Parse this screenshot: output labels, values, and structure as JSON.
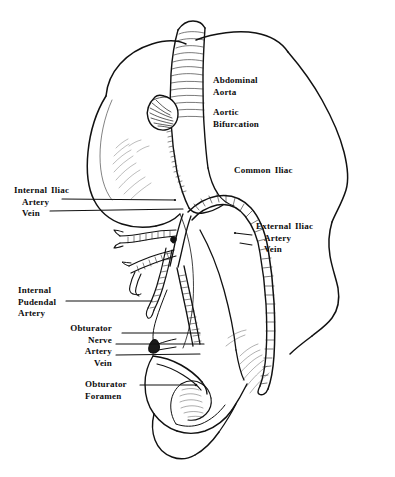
{
  "figure": {
    "background_color": "#ffffff",
    "ink_color": "#111111",
    "width": 395,
    "height": 477
  },
  "labels": {
    "abdominal_aorta": {
      "line1": "Abdominal",
      "line2": "Aorta"
    },
    "aortic_bifurcation": {
      "line1": "Aortic",
      "line2": "Bifurcation"
    },
    "common_iliac": {
      "word1": "Common",
      "word2": "Iliac"
    },
    "internal_iliac": {
      "word1": "Internal",
      "word2": "Iliac",
      "line2": "Artery",
      "line3": "Vein"
    },
    "external_iliac": {
      "word1": "External",
      "word2": "Iliac",
      "line2": "Artery",
      "line3": "Vein"
    },
    "internal_pudendal": {
      "line1": "Internal",
      "line2": "Pudendal",
      "line3": "Artery"
    },
    "obturator_vessels": {
      "line1": "Obturator",
      "line2": "Nerve",
      "line3": "Artery",
      "line4": "Vein"
    },
    "obturator_foramen": {
      "line1": "Obturator",
      "line2": "Foramen"
    }
  }
}
